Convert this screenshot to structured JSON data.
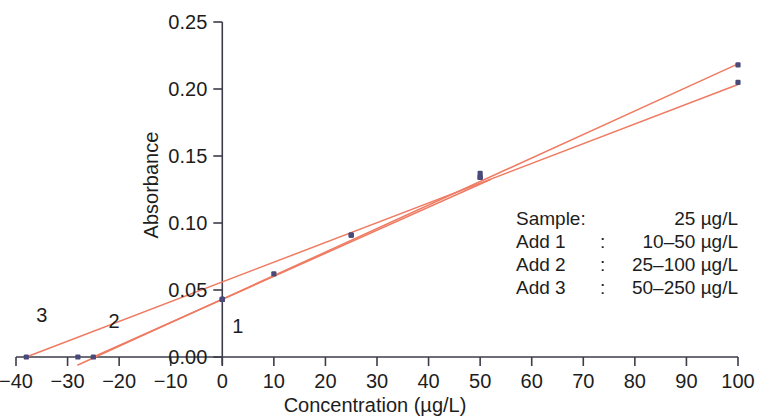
{
  "chart_data": {
    "type": "scatter",
    "title": "",
    "xlabel": "Concentration (µg/L)",
    "ylabel": "Absorbance",
    "xlim": [
      -40,
      100
    ],
    "ylim": [
      0.0,
      0.25
    ],
    "xticks": [
      -40,
      -30,
      -20,
      -10,
      0,
      10,
      20,
      30,
      40,
      50,
      60,
      70,
      80,
      90,
      100
    ],
    "xtick_labels": [
      "−40",
      "−30",
      "−20",
      "−10",
      "0",
      "10",
      "20",
      "30",
      "40",
      "50",
      "60",
      "70",
      "80",
      "90",
      "100"
    ],
    "yticks": [
      0.0,
      0.05,
      0.1,
      0.15,
      0.2,
      0.25
    ],
    "ytick_labels": [
      "0.00",
      "0.05",
      "0.10",
      "0.15",
      "0.20",
      "0.25"
    ],
    "grid": false,
    "legend_position": "inside-right",
    "point_color": "#4a4a7a",
    "line_color": "#ef7b62",
    "series": [
      {
        "name": "1",
        "label": "1",
        "label_x": 3,
        "label_y": 0.018,
        "x_intercept": -25,
        "points": [
          {
            "x": 0,
            "y": 0.043
          },
          {
            "x": 10,
            "y": 0.062
          },
          {
            "x": 25,
            "y": 0.091
          },
          {
            "x": 50,
            "y": 0.137
          }
        ],
        "fit": {
          "slope": 0.00172,
          "intercept": 0.043,
          "x_start": -25,
          "x_end": 52
        }
      },
      {
        "name": "2",
        "label": "2",
        "label_x": -21,
        "label_y": 0.022,
        "x_intercept": -28,
        "points": [
          {
            "x": 0,
            "y": 0.043
          },
          {
            "x": 25,
            "y": 0.091
          },
          {
            "x": 50,
            "y": 0.134
          },
          {
            "x": 100,
            "y": 0.218
          }
        ],
        "fit": {
          "slope": 0.001755,
          "intercept": 0.0432,
          "x_start": -28,
          "x_end": 100
        }
      },
      {
        "name": "3",
        "label": "3",
        "label_x": -35,
        "label_y": 0.026,
        "x_intercept": -38,
        "points": [
          {
            "x": 0,
            "y": 0.043
          },
          {
            "x": 50,
            "y": 0.134
          },
          {
            "x": 100,
            "y": 0.205
          }
        ],
        "fit": {
          "slope": 0.001474,
          "intercept": 0.056,
          "x_start": -38,
          "x_end": 100
        }
      }
    ],
    "x_intercept_markers": [
      {
        "x": -38,
        "y": 0.0
      },
      {
        "x": -28,
        "y": 0.0
      },
      {
        "x": -25,
        "y": 0.0
      }
    ],
    "annotations": {
      "rows": [
        {
          "name": "Sample:",
          "sep": "",
          "value": "25 µg/L"
        },
        {
          "name": "Add 1",
          "sep": ":",
          "value": "10–50 µg/L"
        },
        {
          "name": "Add 2",
          "sep": ":",
          "value": "25–100 µg/L"
        },
        {
          "name": "Add 3",
          "sep": ":",
          "value": "50–250 µg/L"
        }
      ]
    }
  }
}
